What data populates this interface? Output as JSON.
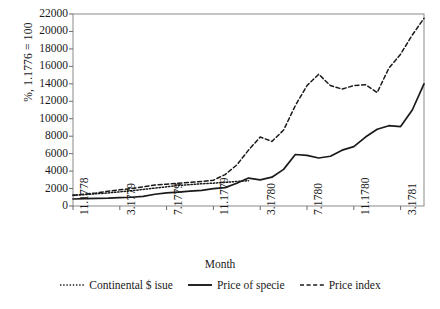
{
  "chart_data": {
    "type": "line",
    "title": "",
    "xlabel": "Month",
    "ylabel": "%, 1.1776 = 100",
    "ylim": [
      0,
      22000
    ],
    "ytick_values": [
      0,
      2000,
      4000,
      6000,
      8000,
      10000,
      12000,
      14000,
      16000,
      18000,
      20000,
      22000
    ],
    "ytick_labels": [
      "0",
      "2000",
      "4000",
      "6000",
      "8000",
      "10000",
      "12000",
      "14000",
      "16000",
      "18000",
      "20000",
      "22000"
    ],
    "xtick_labels": [
      "11.1778",
      "3.1779",
      "7.1779",
      "11.1779",
      "3.1780",
      "7.1780",
      "11.1780",
      "3.1781"
    ],
    "xtick_positions": [
      0,
      4,
      8,
      12,
      16,
      20,
      24,
      28
    ],
    "xlim": [
      0,
      30
    ],
    "grid": false,
    "legend_position": "bottom",
    "series": [
      {
        "name": "Continental $ isue",
        "style": "dotted",
        "x": [
          0,
          1,
          2,
          3,
          4,
          5,
          6,
          7,
          8,
          9,
          10,
          11,
          12,
          13,
          14,
          15
        ],
        "values": [
          1250,
          1300,
          1400,
          1500,
          1620,
          1750,
          1900,
          2050,
          2200,
          2350,
          2450,
          2550,
          2620,
          2700,
          2820,
          2900
        ]
      },
      {
        "name": "Price of specie",
        "style": "solid",
        "x": [
          0,
          1,
          2,
          3,
          4,
          5,
          6,
          7,
          8,
          9,
          10,
          11,
          12,
          13,
          14,
          15,
          16,
          17,
          18,
          19,
          20,
          21,
          22,
          23,
          24,
          25,
          26,
          27,
          28,
          29,
          30
        ],
        "values": [
          800,
          850,
          880,
          900,
          950,
          1000,
          1100,
          1350,
          1500,
          1600,
          1700,
          1800,
          2000,
          2100,
          2600,
          3200,
          3000,
          3300,
          4200,
          5900,
          5800,
          5500,
          5700,
          6400,
          6800,
          7900,
          8800,
          9200,
          9100,
          11000,
          14000
        ]
      },
      {
        "name": "Price index",
        "style": "dashed",
        "x": [
          0,
          1,
          2,
          3,
          4,
          5,
          6,
          7,
          8,
          9,
          10,
          11,
          12,
          13,
          14,
          15,
          16,
          17,
          18,
          19,
          20,
          21,
          22,
          23,
          24,
          25,
          26,
          27,
          28,
          29,
          30
        ],
        "values": [
          1200,
          1350,
          1500,
          1700,
          1850,
          2000,
          2200,
          2400,
          2500,
          2600,
          2700,
          2800,
          2950,
          3600,
          4700,
          6400,
          7900,
          7400,
          8700,
          11500,
          13800,
          15100,
          13800,
          13400,
          13800,
          13900,
          13000,
          15800,
          17400,
          19600,
          21500
        ]
      }
    ]
  },
  "axes": {
    "ylabel_text": "%, 1.1776 = 100",
    "xlabel_text": "Month"
  },
  "legend": {
    "items": [
      {
        "label": "Continental $ isue",
        "style": "dotted"
      },
      {
        "label": "Price of specie",
        "style": "solid"
      },
      {
        "label": "Price index",
        "style": "dashed"
      }
    ]
  },
  "colors": {
    "line": "#1a1a1a",
    "frame": "#8a8a8a",
    "background": "#ffffff"
  }
}
